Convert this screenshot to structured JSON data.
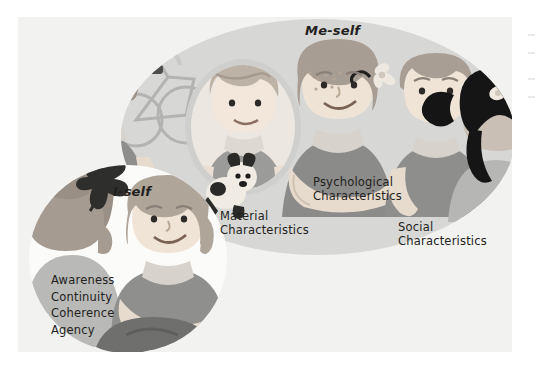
{
  "figure": {
    "title_meself": "Me-self",
    "title_iself": "I-self",
    "captions": {
      "material": "Material\nCharacteristics",
      "psychological": "Psychological\nCharacteristics",
      "social": "Social\nCharacteristics"
    },
    "iself_attributes": "Awareness\nContinuity\nCoherence\nAgency",
    "icons": {
      "meself_ellipse": "me-self-ellipse-shape",
      "iself_circle": "i-self-circle-shape",
      "material_scene": "child-with-bicycle-and-mirror-illustration",
      "psychological_scene": "smiling-girl-with-flower-illustration",
      "social_scene": "two-children-interacting-illustration",
      "iself_scene": "seated-girl-with-kite-illustration"
    },
    "colors": {
      "panel_background": "#f2f2f1",
      "meself_ellipse": "#d7d7d6",
      "iself_circle": "#fbfbfa",
      "text": "#231f20",
      "skin": "#efe3d6",
      "hair_light": "#c4b9ae",
      "hair_dark": "#1a1a1a",
      "shirt_mid": "#9a9a99",
      "shirt_dark": "#7b7b7a",
      "shirt_light": "#c9c9c8"
    }
  }
}
